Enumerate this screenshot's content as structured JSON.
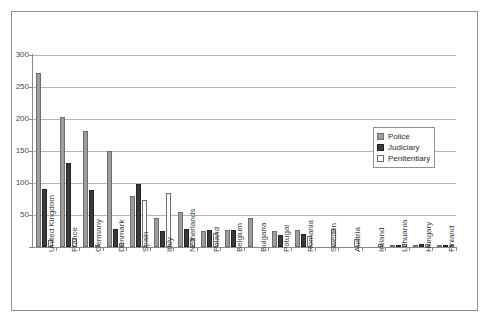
{
  "top_caption": "",
  "chart_data": {
    "type": "bar",
    "title": "",
    "subtitle": "",
    "xlabel": "",
    "ylabel": "",
    "ylim": [
      0,
      300
    ],
    "yticks": [
      0,
      50,
      100,
      150,
      200,
      250,
      300
    ],
    "ytick_labels": [
      "",
      "50",
      "100",
      "150",
      "200",
      "250",
      "300"
    ],
    "grid": true,
    "legend_position": "right",
    "categories": [
      "United Kingdom",
      "France",
      "Germany",
      "Denmark",
      "Spain",
      "Italy",
      "Netherlands",
      "Poland",
      "Belgium",
      "Bulgaria",
      "Potugal",
      "Romania",
      "Sweden",
      "Austria",
      "Ireland",
      "Lithuania",
      "Hungary",
      "Finland"
    ],
    "series": [
      {
        "name": "Police",
        "color": "#9d9d9d",
        "values": [
          272,
          203,
          182,
          150,
          79,
          45,
          54,
          25,
          26,
          45,
          25,
          26,
          0,
          0,
          0,
          2,
          3,
          1
        ]
      },
      {
        "name": "Judiciary",
        "color": "#3a3a3a",
        "values": [
          90,
          132,
          89,
          28,
          99,
          25,
          28,
          27,
          26,
          0,
          18,
          20,
          0,
          0,
          0,
          3,
          4,
          2
        ]
      },
      {
        "name": "Penitentiary",
        "color": "#fdfdfd",
        "values": [
          11,
          14,
          3,
          7,
          73,
          84,
          12,
          22,
          0,
          0,
          0,
          17,
          28,
          12,
          5,
          4,
          4,
          2
        ]
      }
    ]
  },
  "legend": {
    "items": [
      {
        "label": "Police",
        "key": "police"
      },
      {
        "label": "Judiciary",
        "key": "judiciary"
      },
      {
        "label": "Penitentiary",
        "key": "penitentiary"
      }
    ]
  }
}
